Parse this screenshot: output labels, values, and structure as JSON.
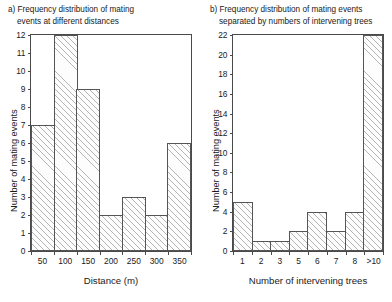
{
  "chart_data": [
    {
      "type": "bar",
      "panel_label": "a)",
      "title": "a) Frequency distribution of mating events at different distances",
      "title_line1": "a) Frequency distribution of mating",
      "title_line2": "events at different distances",
      "categories": [
        "50",
        "100",
        "150",
        "200",
        "250",
        "300",
        "350"
      ],
      "values": [
        7,
        12,
        9,
        2,
        3,
        2,
        6
      ],
      "xlabel": "Distance (m)",
      "ylabel": "Number of mating events",
      "ylim": [
        0,
        12
      ],
      "ytick_values": [
        0,
        1,
        2,
        3,
        4,
        5,
        6,
        7,
        8,
        9,
        10,
        11,
        12
      ],
      "grid": false,
      "legend": "none"
    },
    {
      "type": "bar",
      "panel_label": "b)",
      "title": "b) Frequency distribution of mating events separated by numbers of intervening trees",
      "title_line1": "b) Frequency distribution of mating events",
      "title_line2": "separated by numbers of intervening trees",
      "categories": [
        "1",
        "2",
        "3",
        "5",
        "6",
        "7",
        "8",
        ">10"
      ],
      "values": [
        5,
        1,
        1,
        2,
        4,
        2,
        4,
        22
      ],
      "xlabel": "Number of intervening trees",
      "ylabel": "Number of mating events",
      "ylim": [
        0,
        22
      ],
      "ytick_values": [
        0,
        2,
        4,
        6,
        8,
        10,
        12,
        14,
        16,
        18,
        20,
        22
      ],
      "grid": false,
      "legend": "none"
    }
  ],
  "colors": {
    "background": "#ffffff",
    "axis": "#4a4a4a",
    "bar_outline": "#555555",
    "bar_fill": "#fdfdfd",
    "hatch": "#787878",
    "text": "#1a1a1a"
  }
}
